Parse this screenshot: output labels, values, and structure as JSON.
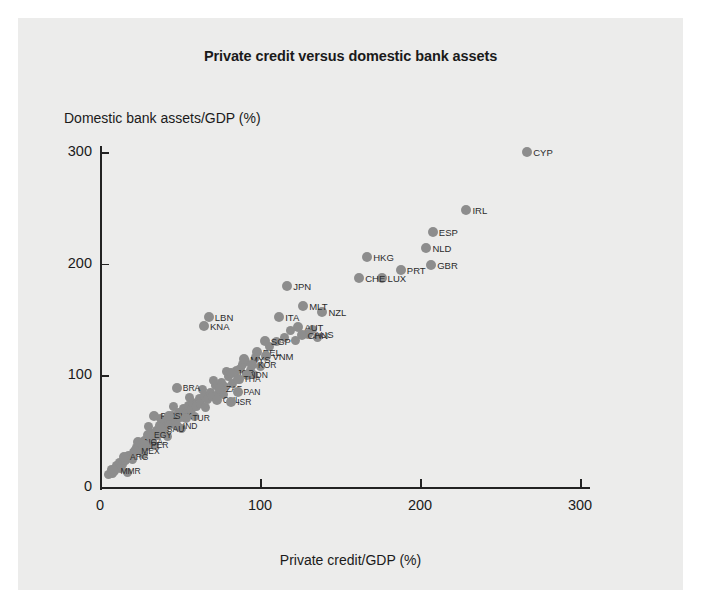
{
  "chart": {
    "title": "Private credit versus domestic bank assets",
    "xlabel": "Private credit/GDP (%)",
    "ylabel": "Domestic bank assets/GDP (%)",
    "background": "#ececeb",
    "point_color": "#8d8d8d",
    "axis_color": "#222222"
  },
  "chart_data": {
    "type": "scatter",
    "title": "Private credit versus domestic bank assets",
    "xlabel": "Private credit/GDP (%)",
    "ylabel": "Domestic bank assets/GDP (%)",
    "xlim": [
      0,
      310
    ],
    "ylim": [
      0,
      320
    ],
    "xticks": [
      0,
      100,
      200,
      300
    ],
    "yticks": [
      0,
      100,
      200,
      300
    ],
    "grid": false,
    "legend": "none",
    "points": [
      {
        "label": "CYP",
        "x": 267,
        "y": 300
      },
      {
        "label": "IRL",
        "x": 229,
        "y": 248
      },
      {
        "label": "ESP",
        "x": 208,
        "y": 228
      },
      {
        "label": "NLD",
        "x": 204,
        "y": 214
      },
      {
        "label": "GBR",
        "x": 207,
        "y": 199
      },
      {
        "label": "PRT",
        "x": 188,
        "y": 194
      },
      {
        "label": "HKG",
        "x": 167,
        "y": 206
      },
      {
        "label": "LUX",
        "x": 176,
        "y": 187
      },
      {
        "label": "CHE",
        "x": 162,
        "y": 187
      },
      {
        "label": "JPN",
        "x": 117,
        "y": 180
      },
      {
        "label": "NZL",
        "x": 139,
        "y": 157
      },
      {
        "label": "MLT",
        "x": 127,
        "y": 162
      },
      {
        "label": "ITA",
        "x": 112,
        "y": 152
      },
      {
        "label": "AUT",
        "x": 124,
        "y": 143
      },
      {
        "label": "AUS",
        "x": 130,
        "y": 137
      },
      {
        "label": "CHN",
        "x": 126,
        "y": 136
      },
      {
        "label": "LBN",
        "x": 68,
        "y": 152
      },
      {
        "label": "KNA",
        "x": 65,
        "y": 144
      },
      {
        "label": "SGP",
        "x": 103,
        "y": 131
      },
      {
        "label": "BEL",
        "x": 98,
        "y": 121
      },
      {
        "label": "VNM",
        "x": 104,
        "y": 117
      },
      {
        "label": "MYS",
        "x": 90,
        "y": 115
      },
      {
        "label": "KOR",
        "x": 95,
        "y": 109
      },
      {
        "label": "JOR",
        "x": 82,
        "y": 102
      },
      {
        "label": "IDN",
        "x": 92,
        "y": 100
      },
      {
        "label": "THA",
        "x": 86,
        "y": 97
      },
      {
        "label": "BRA",
        "x": 48,
        "y": 89
      },
      {
        "label": "ZAF",
        "x": 75,
        "y": 88
      },
      {
        "label": "PAN",
        "x": 86,
        "y": 85
      },
      {
        "label": "CHL",
        "x": 73,
        "y": 78
      },
      {
        "label": "ISR",
        "x": 82,
        "y": 76
      },
      {
        "label": "POL",
        "x": 34,
        "y": 64
      },
      {
        "label": "SVK",
        "x": 43,
        "y": 64
      },
      {
        "label": "TUR",
        "x": 54,
        "y": 62
      },
      {
        "label": "IND",
        "x": 48,
        "y": 55
      },
      {
        "label": "SAU",
        "x": 38,
        "y": 52
      },
      {
        "label": "EGY",
        "x": 30,
        "y": 47
      },
      {
        "label": "NGA",
        "x": 24,
        "y": 40
      },
      {
        "label": "PER",
        "x": 28,
        "y": 38
      },
      {
        "label": "MEX",
        "x": 22,
        "y": 32
      },
      {
        "label": "ARG",
        "x": 15,
        "y": 27
      },
      {
        "label": "MMR",
        "x": 9,
        "y": 14
      }
    ],
    "unlabeled_cluster_points": [
      {
        "x": 5,
        "y": 11
      },
      {
        "x": 7,
        "y": 16
      },
      {
        "x": 10,
        "y": 19
      },
      {
        "x": 12,
        "y": 22
      },
      {
        "x": 14,
        "y": 20
      },
      {
        "x": 16,
        "y": 24
      },
      {
        "x": 18,
        "y": 28
      },
      {
        "x": 20,
        "y": 25
      },
      {
        "x": 21,
        "y": 31
      },
      {
        "x": 23,
        "y": 35
      },
      {
        "x": 25,
        "y": 33
      },
      {
        "x": 26,
        "y": 38
      },
      {
        "x": 28,
        "y": 42
      },
      {
        "x": 29,
        "y": 36
      },
      {
        "x": 31,
        "y": 44
      },
      {
        "x": 32,
        "y": 48
      },
      {
        "x": 33,
        "y": 41
      },
      {
        "x": 35,
        "y": 51
      },
      {
        "x": 36,
        "y": 46
      },
      {
        "x": 37,
        "y": 55
      },
      {
        "x": 39,
        "y": 49
      },
      {
        "x": 40,
        "y": 58
      },
      {
        "x": 41,
        "y": 53
      },
      {
        "x": 43,
        "y": 60
      },
      {
        "x": 44,
        "y": 56
      },
      {
        "x": 45,
        "y": 64
      },
      {
        "x": 47,
        "y": 59
      },
      {
        "x": 49,
        "y": 67
      },
      {
        "x": 50,
        "y": 62
      },
      {
        "x": 52,
        "y": 70
      },
      {
        "x": 54,
        "y": 66
      },
      {
        "x": 55,
        "y": 73
      },
      {
        "x": 57,
        "y": 69
      },
      {
        "x": 58,
        "y": 76
      },
      {
        "x": 60,
        "y": 72
      },
      {
        "x": 62,
        "y": 79
      },
      {
        "x": 63,
        "y": 75
      },
      {
        "x": 65,
        "y": 82
      },
      {
        "x": 67,
        "y": 78
      },
      {
        "x": 69,
        "y": 85
      },
      {
        "x": 70,
        "y": 81
      },
      {
        "x": 72,
        "y": 91
      },
      {
        "x": 74,
        "y": 84
      },
      {
        "x": 76,
        "y": 94
      },
      {
        "x": 78,
        "y": 90
      },
      {
        "x": 80,
        "y": 99
      },
      {
        "x": 83,
        "y": 93
      },
      {
        "x": 85,
        "y": 104
      },
      {
        "x": 88,
        "y": 106
      },
      {
        "x": 91,
        "y": 112
      },
      {
        "x": 94,
        "y": 104
      },
      {
        "x": 97,
        "y": 116
      },
      {
        "x": 100,
        "y": 108
      },
      {
        "x": 106,
        "y": 126
      },
      {
        "x": 110,
        "y": 130
      },
      {
        "x": 115,
        "y": 134
      },
      {
        "x": 119,
        "y": 140
      },
      {
        "x": 122,
        "y": 131
      },
      {
        "x": 133,
        "y": 141
      },
      {
        "x": 136,
        "y": 134
      },
      {
        "x": 17,
        "y": 13
      },
      {
        "x": 13,
        "y": 17
      },
      {
        "x": 8,
        "y": 12
      },
      {
        "x": 27,
        "y": 29
      },
      {
        "x": 34,
        "y": 37
      },
      {
        "x": 42,
        "y": 45
      },
      {
        "x": 51,
        "y": 52
      },
      {
        "x": 59,
        "y": 63
      },
      {
        "x": 66,
        "y": 71
      },
      {
        "x": 77,
        "y": 83
      },
      {
        "x": 87,
        "y": 96
      },
      {
        "x": 96,
        "y": 101
      },
      {
        "x": 30,
        "y": 54
      },
      {
        "x": 38,
        "y": 61
      },
      {
        "x": 46,
        "y": 72
      },
      {
        "x": 56,
        "y": 80
      },
      {
        "x": 64,
        "y": 87
      },
      {
        "x": 71,
        "y": 95
      },
      {
        "x": 79,
        "y": 103
      },
      {
        "x": 89,
        "y": 110
      }
    ]
  }
}
